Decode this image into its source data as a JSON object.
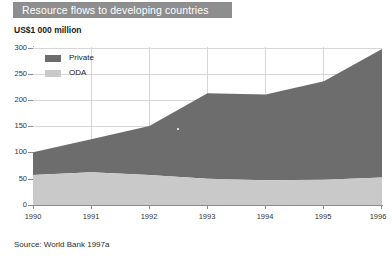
{
  "banner": {
    "title": "Resource flows to developing countries"
  },
  "subtitle": "US$1 000 million",
  "source": "Source: World Bank 1997a",
  "legend": {
    "items": [
      {
        "label": "Private",
        "color": "#6d6d6d",
        "swatch_name": "private-swatch"
      },
      {
        "label": "ODA",
        "color": "#c9c9c9",
        "swatch_name": "oda-swatch"
      }
    ]
  },
  "axes": {
    "y_ticks": [
      "300",
      "250",
      "200",
      "150",
      "100",
      "50",
      "0"
    ],
    "x_ticks": [
      "1990",
      "1991",
      "1992",
      "1993",
      "1994",
      "1995",
      "1996"
    ]
  },
  "chart_data": {
    "type": "area",
    "stacked": true,
    "title": "Resource flows to developing countries",
    "subtitle": "US$1 000 million",
    "xlabel": "",
    "ylabel": "US$1 000 million",
    "ylim": [
      0,
      300
    ],
    "yticks": [
      0,
      50,
      100,
      150,
      200,
      250,
      300
    ],
    "grid": true,
    "legend_position": "inside-top-left",
    "x": [
      "1990",
      "1991",
      "1992",
      "1993",
      "1994",
      "1995",
      "1996"
    ],
    "series": [
      {
        "name": "ODA",
        "color": "#c9c9c9",
        "values": [
          57,
          62,
          57,
          50,
          47,
          48,
          52
        ]
      },
      {
        "name": "Private",
        "color": "#6d6d6d",
        "values": [
          43,
          63,
          93,
          162,
          163,
          187,
          244
        ]
      }
    ],
    "totals": [
      100,
      125,
      150,
      212,
      210,
      235,
      296
    ],
    "source": "Source: World Bank 1997a"
  }
}
